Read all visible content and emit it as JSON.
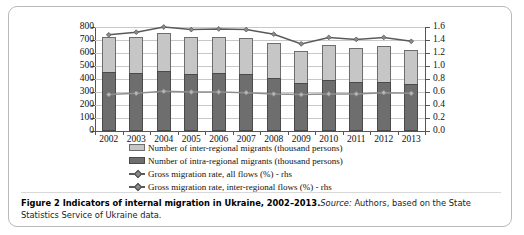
{
  "figure": {
    "caption_bold": "Figure 2 Indicators of internal migration in Ukraine, 2002–2013.",
    "caption_source_label": "Source:",
    "caption_rest": " Authors, based on the State Statistics Service of Ukraine data."
  },
  "legend": {
    "items": [
      {
        "marker": "light-gray-swatch",
        "label": "Number of inter-regional migrants (thousand persons)"
      },
      {
        "marker": "dark-gray-swatch",
        "label": "Number of intra-regional migrants (thousand persons)"
      },
      {
        "marker": "line-diamond-dark",
        "label": "Gross migration rate, all flows (%) - rhs"
      },
      {
        "marker": "line-diamond-light",
        "label": "Gross migration rate, inter-regional flows (%) - rhs"
      }
    ]
  },
  "colors": {
    "inter_regional_fill": "#c6c6c6",
    "intra_regional_fill": "#6e6e6e",
    "line_all_flows": "#5a5a5a",
    "line_inter_regional": "#8f8f8f",
    "grid": "#c8c8c8",
    "frame": "#b9b9b9"
  },
  "chart_data": {
    "type": "bar",
    "title": "",
    "xlabel": "",
    "ylabel": "",
    "grid": true,
    "legend_position": "bottom",
    "categories": [
      "2002",
      "2003",
      "2004",
      "2005",
      "2006",
      "2007",
      "2008",
      "2009",
      "2010",
      "2011",
      "2012",
      "2013"
    ],
    "y_left": {
      "label": "thousand persons",
      "lim": [
        0,
        800
      ],
      "step": 100,
      "ticks": [
        "0",
        "100",
        "200",
        "300",
        "400",
        "500",
        "600",
        "700",
        "800"
      ]
    },
    "y_right": {
      "label": "%",
      "lim": [
        0.0,
        1.6
      ],
      "step": 0.2,
      "ticks": [
        "0.0",
        "0.2",
        "0.4",
        "0.6",
        "0.8",
        "1.0",
        "1.2",
        "1.4",
        "1.6"
      ]
    },
    "series": [
      {
        "name": "Number of intra-regional migrants (thousand persons)",
        "axis": "left",
        "type": "bar-stacked-bottom",
        "values": [
          452,
          448,
          461,
          441,
          446,
          438,
          411,
          369,
          395,
          380,
          380,
          360
        ]
      },
      {
        "name": "Number of inter-regional migrants (thousand persons)",
        "axis": "left",
        "type": "bar-stacked-top",
        "values": [
          268,
          277,
          292,
          285,
          280,
          277,
          268,
          245,
          263,
          258,
          275,
          266
        ]
      },
      {
        "name": "Gross migration rate, all flows (%) - rhs",
        "axis": "right",
        "type": "line",
        "values": [
          1.48,
          1.52,
          1.6,
          1.56,
          1.57,
          1.56,
          1.49,
          1.34,
          1.44,
          1.41,
          1.44,
          1.38
        ]
      },
      {
        "name": "Gross migration rate, inter-regional flows (%) - rhs",
        "axis": "right",
        "type": "line",
        "values": [
          0.56,
          0.58,
          0.61,
          0.6,
          0.6,
          0.59,
          0.57,
          0.56,
          0.57,
          0.57,
          0.59,
          0.58
        ]
      }
    ],
    "totals": [
      720,
      725,
      753,
      726,
      726,
      715,
      679,
      614,
      658,
      638,
      655,
      626
    ]
  }
}
